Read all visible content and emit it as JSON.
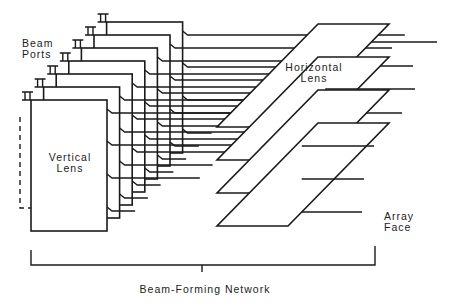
{
  "labels": {
    "beam_ports": "Beam\nPorts",
    "vertical_lens": "Vertical\nLens",
    "horizontal_lens": "Horizontal\nLens",
    "array_face": "Array\nFace",
    "beam_forming_network": "Beam-Forming Network"
  },
  "colors": {
    "stroke": "#1a1a1a",
    "fill": "#ffffff",
    "text": "#222222"
  },
  "vertical_lenses": {
    "count": 7,
    "front": {
      "left": 31,
      "top": 100,
      "right": 107,
      "bottom": 231
    },
    "step": {
      "dx": 12.6,
      "dy": -13
    },
    "output_offsets_y": [
      13,
      45,
      78,
      111
    ]
  },
  "horizontal_lenses": {
    "count": 4,
    "front": {
      "bl": [
        217,
        226
      ],
      "br": [
        288,
        226
      ],
      "tr": [
        389,
        123
      ],
      "tl": [
        318,
        123
      ]
    },
    "step_dy": -33,
    "array_face_line_ends": [
      440,
      415,
      415,
      402,
      380,
      372,
      372
    ]
  },
  "bracket": {
    "x1": 31,
    "x2": 375,
    "y": 265,
    "top": 250,
    "tick_x": 202,
    "tick_bottom": 272
  }
}
